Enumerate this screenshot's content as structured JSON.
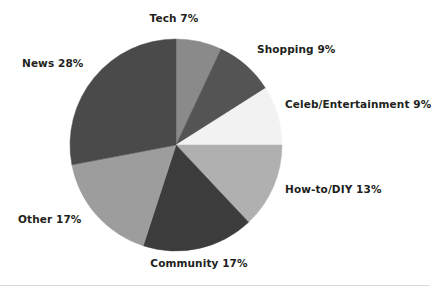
{
  "chart_data": {
    "type": "pie",
    "title": "",
    "subtitle": "",
    "xlabel": "",
    "ylabel": "",
    "legend_position": "none",
    "grid": false,
    "start_angle_deg": 0,
    "direction": "clockwise",
    "center": {
      "x": 176,
      "y": 145
    },
    "radius": 106,
    "categories": [
      "Tech",
      "Shopping",
      "Celeb/Entertainment",
      "How-to/DIY",
      "Community",
      "Other",
      "News"
    ],
    "values": [
      7,
      9,
      9,
      13,
      17,
      17,
      28
    ],
    "value_unit": "%",
    "slices": [
      {
        "label": "Tech",
        "value": 7,
        "display": "Tech  7%",
        "color": "#8a8a8a"
      },
      {
        "label": "Shopping",
        "value": 9,
        "display": "Shopping  9%",
        "color": "#545454"
      },
      {
        "label": "Celeb/Entertainment",
        "value": 9,
        "display": "Celeb/Entertainment  9%",
        "color": "#f2f2f2"
      },
      {
        "label": "How-to/DIY",
        "value": 13,
        "display": "How-to/DIY  13%",
        "color": "#b0b0b0"
      },
      {
        "label": "Community",
        "value": 17,
        "display": "Community  17%",
        "color": "#3c3c3c"
      },
      {
        "label": "Other",
        "value": 17,
        "display": "Other  17%",
        "color": "#9d9d9d"
      },
      {
        "label": "News",
        "value": 28,
        "display": "News  28%",
        "color": "#4a4a4a"
      }
    ]
  },
  "labels": {
    "tech": "Tech  7%",
    "shopping": "Shopping  9%",
    "celeb": "Celeb/Entertainment  9%",
    "howto": "How-to/DIY  13%",
    "community": "Community  17%",
    "other": "Other  17%",
    "news": "News  28%"
  },
  "style": {
    "background": "#ffffff",
    "text_color": "#231f20",
    "rule_color": "#d9dadb"
  }
}
